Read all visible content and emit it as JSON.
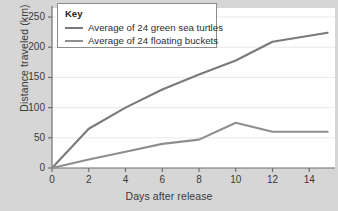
{
  "chart_data": {
    "type": "line",
    "title": "",
    "xlabel": "Days after release",
    "ylabel": "Distance traveled (km)",
    "xlim": [
      0,
      15.4
    ],
    "ylim": [
      0,
      265
    ],
    "xticks": [
      0,
      2,
      4,
      6,
      8,
      10,
      12,
      14
    ],
    "yticks": [
      0,
      50,
      100,
      150,
      200,
      250
    ],
    "xtick_labels": [
      "0",
      "2",
      "4",
      "6",
      "8",
      "10",
      "12",
      "14"
    ],
    "ytick_labels": [
      "0",
      "50",
      "100",
      "150",
      "200",
      "250"
    ],
    "grid": "horizontal",
    "legend_position": "top-left-inside",
    "legend_title": "Key",
    "series": [
      {
        "name": "Average of 24 green sea turtles",
        "color": "#7a7a7a",
        "x": [
          0,
          2,
          4,
          6,
          8,
          10,
          12,
          15
        ],
        "values": [
          0,
          65,
          100,
          130,
          155,
          178,
          209,
          224
        ]
      },
      {
        "name": "Average of 24 floating buckets",
        "color": "#8e8e8e",
        "x": [
          0,
          2,
          4,
          6,
          8,
          10,
          12,
          15
        ],
        "values": [
          0,
          14,
          27,
          40,
          47,
          75,
          60,
          60
        ]
      }
    ]
  },
  "axes": {
    "y_axis_name": "distance-traveled-km",
    "x_axis_name": "days-after-release"
  },
  "colors": {
    "background": "#d6d6d6",
    "plot_background": "#ffffff",
    "axis": "#6f6f6f",
    "grid": "#e9e9e9",
    "text": "#3a3a3a",
    "legend_border": "#8c8c8c"
  }
}
